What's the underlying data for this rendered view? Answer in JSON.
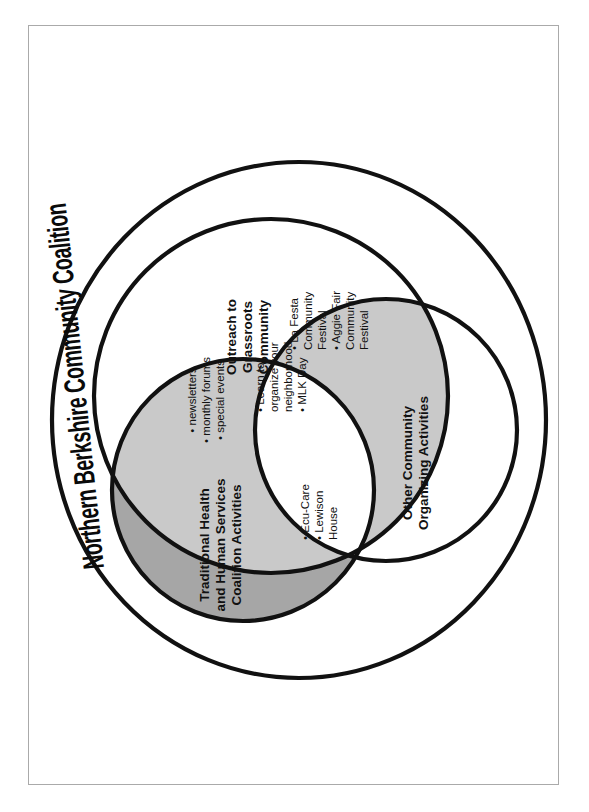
{
  "document": {
    "kind": "venn-diagram",
    "title": "Northern Berkshire Community Coalition",
    "orientation": "rotated-90-ccw"
  },
  "colors": {
    "stroke": "#111111",
    "page_border": "#aaaaaa",
    "shade_dark": "#a6a6a6",
    "shade_light": "#c9c9c9",
    "background": "#ffffff",
    "text": "#111111"
  },
  "sets": {
    "outer": {
      "label": "Northern Berkshire Community Coalition"
    },
    "outreach": {
      "label_lines": [
        "Outreach to",
        "Grassroots",
        "Community"
      ]
    },
    "traditional": {
      "label_lines": [
        "Traditional Health",
        "and Human Services",
        "Coalition Activities"
      ]
    },
    "other": {
      "label_lines": [
        "Other Community",
        "Organizing Activities"
      ]
    }
  },
  "regions": {
    "outreach_traditional": {
      "name": "outreach-and-traditional-overlap",
      "shade": "light",
      "items": [
        "newsletters",
        "monthly forums",
        "special events"
      ]
    },
    "center_all_three": {
      "name": "all-three-overlap",
      "shade": "none",
      "items": [
        "Learn to organize your neighborhood",
        "MLK Day"
      ]
    },
    "outreach_other": {
      "name": "outreach-and-other-overlap",
      "shade": "light",
      "items": [
        "La Festa Community Festival",
        "Aggie Fair Community Festival"
      ]
    },
    "traditional_other": {
      "name": "traditional-and-other-overlap",
      "shade": "light",
      "items": [
        "Ecu-Care",
        "Lewison House"
      ]
    }
  },
  "bullets": {
    "glyph": "•",
    "outreach_traditional": [
      {
        "glyph": "•",
        "lines": [
          "newsletters"
        ]
      },
      {
        "glyph": "•",
        "lines": [
          "monthly forums"
        ]
      },
      {
        "glyph": "•",
        "lines": [
          "special events"
        ]
      }
    ],
    "center": [
      {
        "glyph": "•",
        "lines": [
          "Learn to",
          "organize your",
          "neighborhood"
        ]
      },
      {
        "glyph": "•",
        "lines": [
          "MLK Day"
        ]
      }
    ],
    "outreach_other": [
      {
        "glyph": "•",
        "lines": [
          "La Festa",
          "Community",
          "Festival"
        ]
      },
      {
        "glyph": "•",
        "lines": [
          "Aggie Fair",
          "Community",
          "Festival"
        ]
      }
    ],
    "traditional_other": [
      {
        "glyph": "•",
        "lines": [
          "Ecu-Care"
        ]
      },
      {
        "glyph": "•",
        "lines": [
          "Lewison",
          "House"
        ]
      }
    ]
  },
  "text": {
    "title": "Northern Berkshire Community Coalition",
    "outreach_l1": "Outreach to",
    "outreach_l2": "Grassroots",
    "outreach_l3": "Community",
    "traditional_l1": "Traditional Health",
    "traditional_l2": "and Human Services",
    "traditional_l3": "Coalition Activities",
    "other_l1": "Other Community",
    "other_l2": "Organizing Activities",
    "b_newsletters": "• newsletters",
    "b_monthly_forums": "• monthly forums",
    "b_special_events": "• special events",
    "b_learn_l1": "• Learn to",
    "b_learn_l2": "organize your",
    "b_learn_l3": "neighborhood",
    "b_mlk": "• MLK Day",
    "b_lafesta_l1": "• La Festa",
    "b_lafesta_l2": "Community",
    "b_lafesta_l3": "Festival",
    "b_aggie_l1": "• Aggie Fair",
    "b_aggie_l2": "Community",
    "b_aggie_l3": "Festival",
    "b_ecucare": "• Ecu-Care",
    "b_lewison_l1": "• Lewison",
    "b_lewison_l2": "House"
  }
}
